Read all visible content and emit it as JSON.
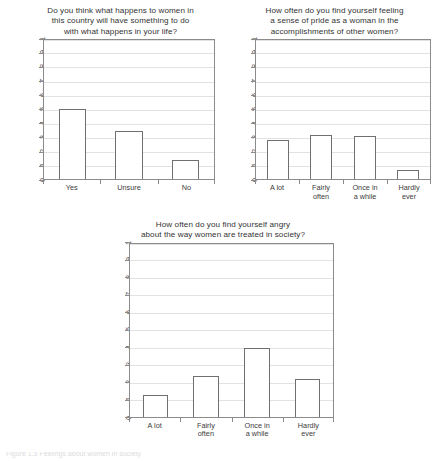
{
  "page": {
    "background": "#ffffff",
    "axis_color": "#8b8b8b",
    "bar_edge_color": "#6f6f6f",
    "bar_fill_color": "#ffffff",
    "grid_color": "#e2e2e2",
    "text_color": "#333333"
  },
  "caption": {
    "text": "Figure 1.5  Feelings about women in society"
  },
  "charts": [
    {
      "id": "chart-1",
      "title": "Do you think what happens to women in\nthis country will have something to do\nwith what happens in your life?",
      "chart_data": {
        "type": "bar",
        "title": "Do you think what happens to women in this country will have something to do with what happens in your life?",
        "xlabel": "",
        "ylabel": "",
        "ylim": [
          0,
          1
        ],
        "grid": true,
        "legend": "none",
        "categories": [
          "Yes",
          "Unsure",
          "No"
        ],
        "values": [
          0.505,
          0.35,
          0.14
        ],
        "yticks": [
          0,
          0.1,
          0.2,
          0.3,
          0.4,
          0.5,
          0.6,
          0.7,
          0.8,
          0.9,
          1
        ],
        "ytick_labels": [
          "0",
          ".1",
          ".2",
          ".3",
          ".4",
          ".5",
          ".6",
          ".7",
          ".8",
          ".9",
          "1"
        ]
      }
    },
    {
      "id": "chart-2",
      "title": "How often do you find yourself feeling\na sense of pride as a woman in the\naccomplishments of other women?",
      "chart_data": {
        "type": "bar",
        "title": "How often do you find yourself feeling a sense of pride as a woman in the accomplishments of other women?",
        "xlabel": "",
        "ylabel": "",
        "ylim": [
          0,
          1
        ],
        "grid": true,
        "legend": "none",
        "categories": [
          "A lot",
          "Fairly\noften",
          "Once in\na while",
          "Hardly\never"
        ],
        "values": [
          0.285,
          0.32,
          0.31,
          0.065
        ],
        "yticks": [
          0,
          0.1,
          0.2,
          0.3,
          0.4,
          0.5,
          0.6,
          0.7,
          0.8,
          0.9,
          1
        ],
        "ytick_labels": [
          "0",
          ".1",
          ".2",
          ".3",
          ".4",
          ".5",
          ".6",
          ".7",
          ".8",
          ".9",
          "1"
        ]
      }
    },
    {
      "id": "chart-3",
      "title": "How often do you find yourself angry\nabout the way women are treated in society?",
      "chart_data": {
        "type": "bar",
        "title": "How often do you find yourself angry about the way women are treated in society?",
        "xlabel": "",
        "ylabel": "",
        "ylim": [
          0,
          1
        ],
        "grid": true,
        "legend": "none",
        "categories": [
          "A lot",
          "Fairly\noften",
          "Once in\na while",
          "Hardly\never"
        ],
        "values": [
          0.125,
          0.235,
          0.398,
          0.22
        ],
        "yticks": [
          0,
          0.1,
          0.2,
          0.3,
          0.4,
          0.5,
          0.6,
          0.7,
          0.8,
          0.9,
          1
        ],
        "ytick_labels": [
          "0",
          ".1",
          ".2",
          ".3",
          ".4",
          ".5",
          ".6",
          ".7",
          ".8",
          ".9",
          "1"
        ]
      }
    }
  ]
}
